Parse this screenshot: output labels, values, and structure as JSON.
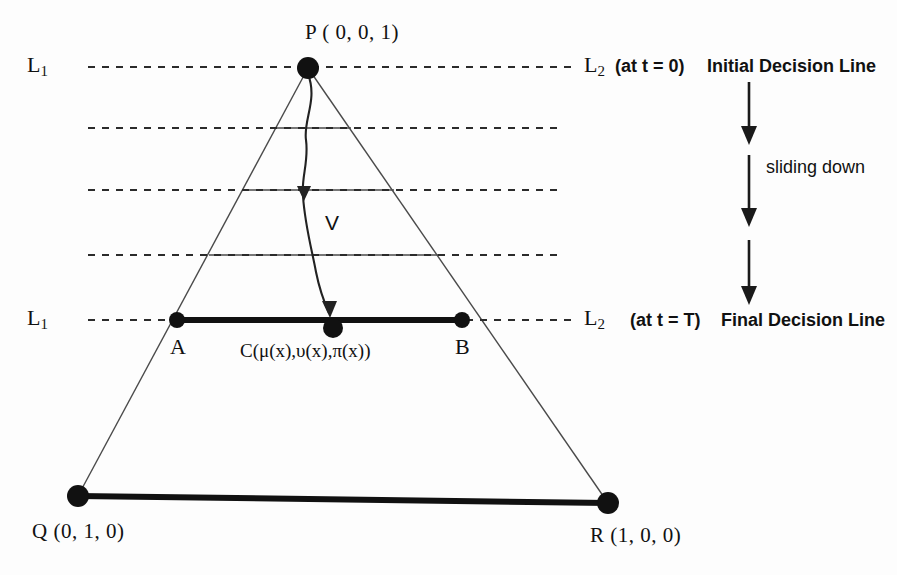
{
  "diagram": {
    "title_vertex_top": "P ( 0, 0, 1)",
    "vertex_bottom_left": "Q (0, 1, 0)",
    "vertex_bottom_right": "R (1, 0, 0)",
    "point_a": "A",
    "point_b": "B",
    "center_point_label": "C(μ(x),υ(x),π(x))",
    "velocity_label": "V",
    "left_line_top": {
      "name": "L",
      "subscript": "1"
    },
    "left_line_bottom": {
      "name": "L",
      "subscript": "1"
    },
    "right_line_top": {
      "name": "L",
      "subscript": "2"
    },
    "right_line_bottom": {
      "name": "L",
      "subscript": "2"
    },
    "initial_time": "(at  t = 0)",
    "initial_decision": "Initial Decision Line",
    "final_time": "(at t = T)",
    "final_decision": "Final Decision Line",
    "motion_label": "sliding down",
    "colors": {
      "ink": "#111111",
      "thin_stroke": "#555555",
      "background": "#fdfdfd"
    }
  }
}
